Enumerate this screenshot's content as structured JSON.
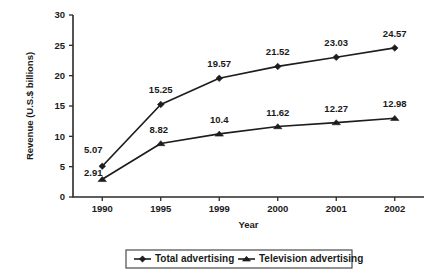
{
  "chart_data": {
    "type": "line",
    "title": "",
    "subtitle": "",
    "xlabel": "Year",
    "ylabel": "Revenue (U.S.$ billions)",
    "categories": [
      "1990",
      "1995",
      "1999",
      "2000",
      "2001",
      "2002"
    ],
    "ylim": [
      0,
      30
    ],
    "yticks": [
      0,
      5,
      10,
      15,
      20,
      25,
      30
    ],
    "ytick_labels": [
      "0",
      "5",
      "10",
      "15",
      "20",
      "25",
      "30"
    ],
    "grid": false,
    "legend_position": "bottom",
    "series": [
      {
        "name": "Total advertising",
        "marker": "diamond",
        "values": [
          5.07,
          15.25,
          19.57,
          21.52,
          23.03,
          24.57
        ],
        "labels": [
          "5.07",
          "15.25",
          "19.57",
          "21.52",
          "23.03",
          "24.57"
        ]
      },
      {
        "name": "Television advertising",
        "marker": "triangle",
        "values": [
          2.91,
          8.82,
          10.4,
          11.62,
          12.27,
          12.98
        ],
        "labels": [
          "2.91",
          "8.82",
          "10.4",
          "11.62",
          "12.27",
          "12.98"
        ]
      }
    ],
    "colors": {
      "line": "#1d1d1d",
      "axis": "#2b2b2b",
      "text": "#1a1a1a",
      "background": "#ffffff",
      "legend_border": "#4a4a4a"
    }
  },
  "legend": {
    "items": [
      {
        "label": "Total advertising",
        "marker": "diamond"
      },
      {
        "label": "Television advertising",
        "marker": "triangle"
      }
    ]
  },
  "axis": {
    "x_title": "Year",
    "y_title": "Revenue (U.S.$ billions)"
  }
}
